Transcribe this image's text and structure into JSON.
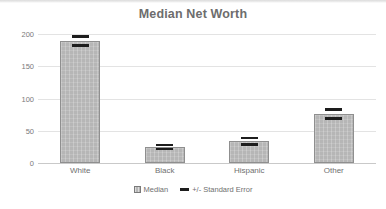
{
  "chart_data": {
    "type": "bar",
    "title": "Median Net Worth",
    "xlabel": "",
    "ylabel": "",
    "categories": [
      "White",
      "Black",
      "Hispanic",
      "Other"
    ],
    "values": [
      189,
      25,
      34,
      76
    ],
    "errors": [
      7,
      3,
      5,
      7
    ],
    "series": [
      {
        "name": "Median",
        "values": [
          189,
          25,
          34,
          76
        ]
      }
    ],
    "error_series": {
      "name": "+/- Standard Error",
      "values": [
        7,
        3,
        5,
        7
      ]
    },
    "ylim": [
      0,
      200
    ],
    "yticks": [
      0,
      50,
      100,
      150,
      200
    ],
    "ytick_labels": [
      "0",
      "50",
      "100",
      "150",
      "200"
    ],
    "grid": true,
    "legend_position": "bottom",
    "legend": [
      {
        "label": "Median",
        "swatch": "median-swatch-icon"
      },
      {
        "label": "+/- Standard Error",
        "swatch": "error-bar-swatch-icon"
      }
    ],
    "colors": {
      "bar_fill": "#b6b6b6",
      "bar_border": "#8f8f8f",
      "error_bar": "#1d1d1d",
      "gridline": "#e3e3e3",
      "axis_line": "#c9c9c9",
      "title_text": "#6d6d6d",
      "tick_text": "#7a7a7a",
      "background": "#ffffff"
    }
  }
}
